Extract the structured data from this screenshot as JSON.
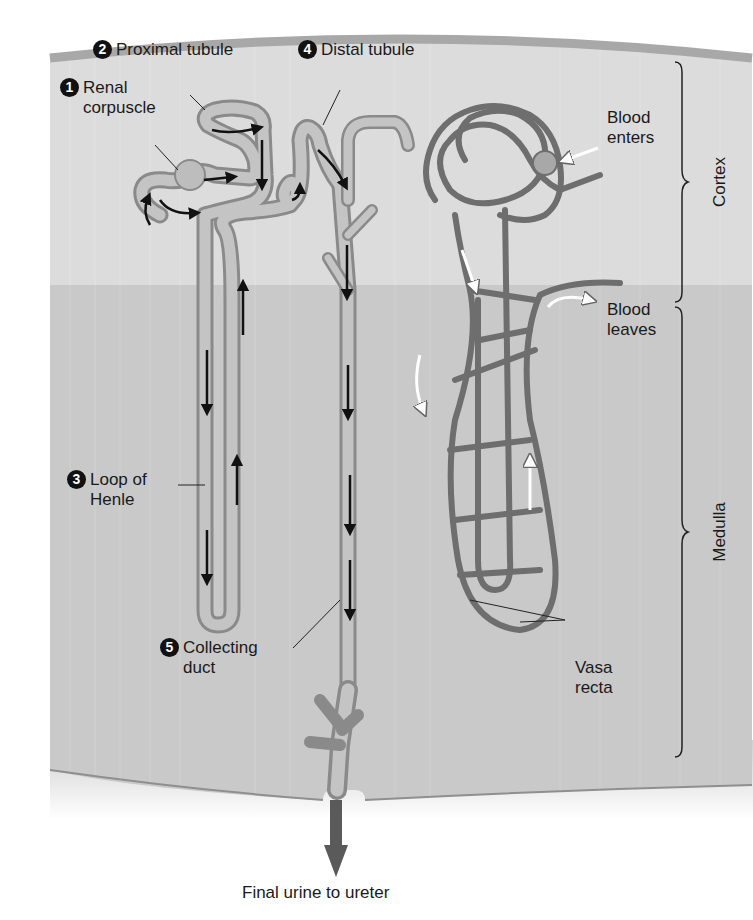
{
  "diagram": {
    "regions": [
      {
        "label": "Cortex"
      },
      {
        "label": "Medulla"
      }
    ],
    "structures": [
      {
        "number": "1",
        "label_line1": "Renal",
        "label_line2": "corpuscle"
      },
      {
        "number": "2",
        "label_line1": "Proximal tubule"
      },
      {
        "number": "3",
        "label_line1": "Loop of",
        "label_line2": "Henle"
      },
      {
        "number": "4",
        "label_line1": "Distal tubule"
      },
      {
        "number": "5",
        "label_line1": "Collecting",
        "label_line2": "duct"
      }
    ],
    "blood_labels": {
      "enters_line1": "Blood",
      "enters_line2": "enters",
      "leaves_line1": "Blood",
      "leaves_line2": "leaves",
      "vasa_line1": "Vasa",
      "vasa_line2": "recta"
    },
    "caption": "Final urine to ureter",
    "colors": {
      "cortex_bg": "#dcdcdc",
      "medulla_bg": "#c9c9c9",
      "tubule": "#b8b8b8",
      "tubule_edge": "#8a8a8a",
      "vessel": "#6e6e6e",
      "arrow": "#111111",
      "ureter_arrow": "#555555"
    }
  }
}
